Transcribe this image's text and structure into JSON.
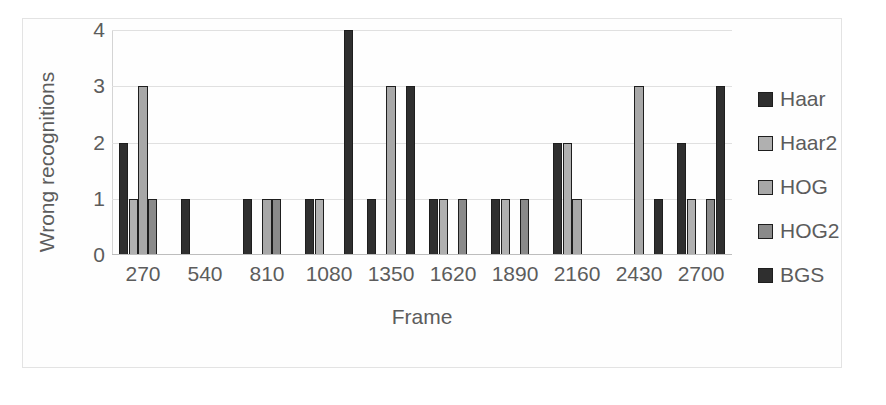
{
  "chart_data": {
    "type": "bar",
    "title": "",
    "xlabel": "Frame",
    "ylabel": "Wrong recognitions",
    "categories": [
      "270",
      "540",
      "810",
      "1080",
      "1350",
      "1620",
      "1890",
      "2160",
      "2430",
      "2700"
    ],
    "ylim": [
      0,
      4
    ],
    "y_ticks": [
      "0",
      "1",
      "2",
      "3",
      "4"
    ],
    "grid": true,
    "legend_position": "right",
    "series": [
      {
        "name": "Haar",
        "color": "#2f2f2f",
        "values": [
          2,
          1,
          1,
          1,
          1,
          1,
          1,
          2,
          0,
          2
        ]
      },
      {
        "name": "Haar2",
        "color": "#b0b0b0",
        "values": [
          1,
          0,
          0,
          1,
          0,
          1,
          1,
          2,
          0,
          1
        ]
      },
      {
        "name": "HOG",
        "color": "#a8a8a8",
        "values": [
          3,
          0,
          1,
          0,
          3,
          0,
          0,
          1,
          3,
          0
        ]
      },
      {
        "name": "HOG2",
        "color": "#8a8a8a",
        "values": [
          1,
          0,
          1,
          0,
          0,
          1,
          1,
          0,
          0,
          1
        ]
      },
      {
        "name": "BGS",
        "color": "#2f2f2f",
        "values": [
          0,
          0,
          0,
          4,
          3,
          0,
          0,
          0,
          1,
          3
        ]
      }
    ]
  },
  "legend": {
    "entries": [
      {
        "label": "Haar",
        "swatch": "#2f2f2f"
      },
      {
        "label": "Haar2",
        "swatch": "#b0b0b0"
      },
      {
        "label": "HOG",
        "swatch": "#a8a8a8"
      },
      {
        "label": "HOG2",
        "swatch": "#8a8a8a"
      },
      {
        "label": "BGS",
        "swatch": "#2f2f2f"
      }
    ]
  },
  "colors": {
    "gridline": "#e0e0e0",
    "axis_text": "#5c5c5c",
    "bar_outline": "#1e1e1e",
    "frame_border": "#e3e3e3",
    "background": "#ffffff"
  }
}
